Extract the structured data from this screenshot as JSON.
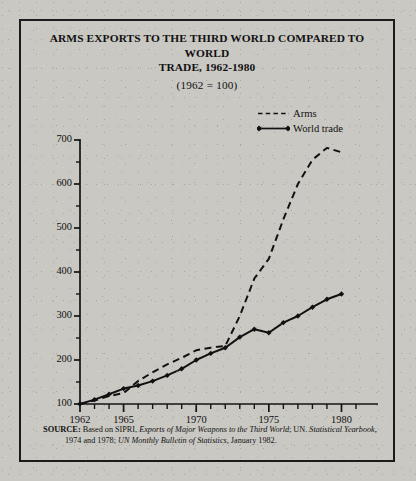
{
  "figure": {
    "title_lines": [
      "ARMS EXPORTS TO THE THIRD WORLD COMPARED TO WORLD",
      "TRADE, 1962-1980"
    ],
    "subtitle": "(1962 = 100)",
    "source_prefix": "SOURCE:",
    "source_line1_a": "Based on SIPRI, ",
    "source_line1_b": "Exports of Major Weapons to the Third World",
    "source_line1_c": "; UN. ",
    "source_line1_d": "Statistical Yearbook,",
    "source_line2_a": "1974 and 1978; ",
    "source_line2_b": "UN Monthly Bulletin of Statistics,",
    "source_line2_c": " January 1982."
  },
  "chart_data": {
    "type": "line",
    "title": "ARMS EXPORTS TO THE THIRD WORLD COMPARED TO WORLD TRADE, 1962-1980",
    "subtitle": "(1962 = 100)",
    "xlabel": "",
    "ylabel": "",
    "xlim": [
      1962,
      1981
    ],
    "ylim": [
      100,
      700
    ],
    "yticks": [
      100,
      200,
      300,
      400,
      500,
      600,
      700
    ],
    "yminorticks": [
      150,
      250,
      350,
      450,
      550,
      650
    ],
    "xticks": [
      1962,
      1963,
      1964,
      1965,
      1966,
      1967,
      1968,
      1969,
      1970,
      1971,
      1972,
      1973,
      1974,
      1975,
      1976,
      1977,
      1978,
      1979,
      1980,
      1981
    ],
    "xticklabels": [
      "1962",
      "",
      "",
      "1965",
      "",
      "",
      "",
      "",
      "1970",
      "",
      "",
      "",
      "",
      "1975",
      "",
      "",
      "",
      "",
      "1980",
      ""
    ],
    "grid": false,
    "legend_position": "top-right",
    "x": [
      1962,
      1963,
      1964,
      1965,
      1966,
      1967,
      1968,
      1969,
      1970,
      1971,
      1972,
      1973,
      1974,
      1975,
      1976,
      1977,
      1978,
      1979,
      1980
    ],
    "series": [
      {
        "name": "Arms",
        "style": "dashed",
        "marker": "none",
        "color": "#111111",
        "values": [
          100,
          108,
          118,
          125,
          152,
          172,
          190,
          205,
          222,
          228,
          232,
          300,
          385,
          430,
          520,
          600,
          655,
          682,
          672
        ]
      },
      {
        "name": "World trade",
        "style": "solid",
        "marker": "diamond",
        "color": "#111111",
        "values": [
          100,
          110,
          122,
          135,
          142,
          152,
          165,
          180,
          200,
          215,
          228,
          252,
          270,
          262,
          285,
          300,
          320,
          338,
          350
        ]
      }
    ]
  },
  "legend": {
    "items": [
      {
        "label": "Arms",
        "style": "dashed",
        "marker": "none"
      },
      {
        "label": "World trade",
        "style": "solid",
        "marker": "diamond"
      }
    ]
  }
}
